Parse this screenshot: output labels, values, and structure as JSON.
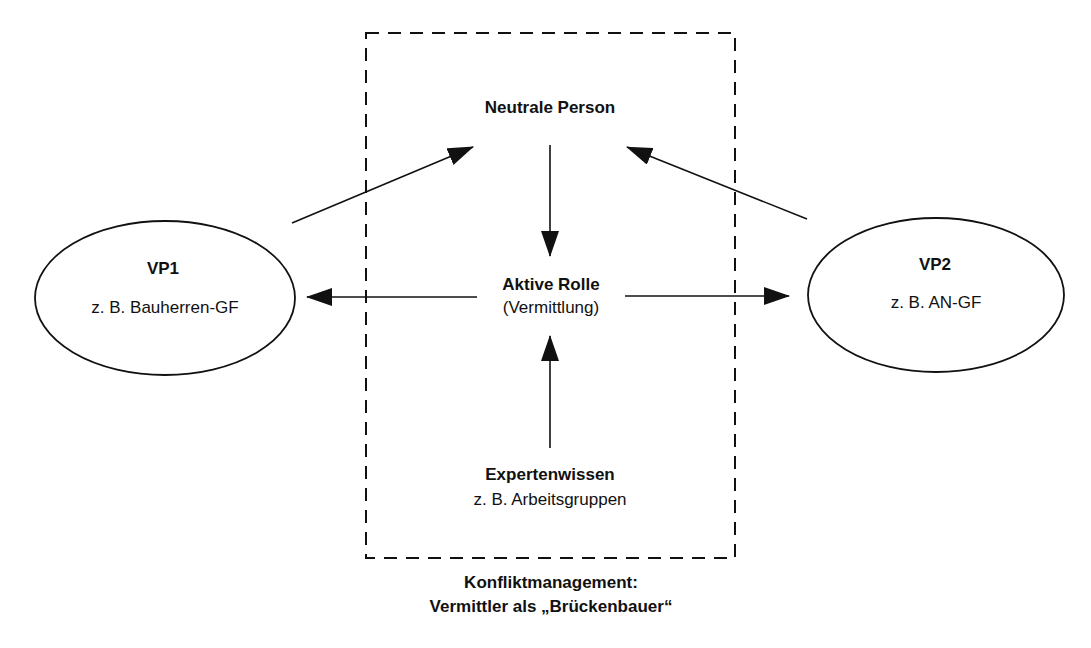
{
  "diagram": {
    "center": {
      "neutral_person": "Neutrale Person",
      "active_role_title": "Aktive Rolle",
      "active_role_sub": "(Vermittlung)",
      "expert_title": "Expertenwissen",
      "expert_sub": "z. B. Arbeitsgruppen"
    },
    "left_party": {
      "title": "VP1",
      "subtitle": "z. B. Bauherren-GF"
    },
    "right_party": {
      "title": "VP2",
      "subtitle": "z. B. AN-GF"
    },
    "caption_line1": "Konfliktmanagement:",
    "caption_line2": "Vermittler als „Brückenbauer“",
    "colors": {
      "stroke": "#111111",
      "background": "#ffffff"
    }
  }
}
